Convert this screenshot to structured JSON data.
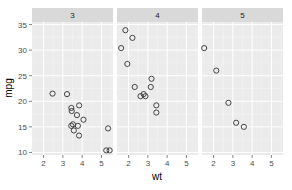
{
  "chart_data": {
    "type": "scatter",
    "facet_by": "gear",
    "xlabel": "wt",
    "ylabel": "mpg",
    "x_ticks": [
      2,
      3,
      4,
      5
    ],
    "y_ticks": [
      10,
      15,
      20,
      25,
      30,
      35
    ],
    "xlim": [
      1.4,
      5.6
    ],
    "ylim": [
      9.5,
      35.5
    ],
    "grid": true,
    "legend": "none",
    "colors": {
      "panel_bg": "#ebebeb",
      "strip_bg": "#d9d9d9",
      "grid_major": "#ffffff",
      "point_stroke": "#333333"
    },
    "panels": [
      {
        "label": "3",
        "points": [
          {
            "x": 3.215,
            "y": 21.4
          },
          {
            "x": 3.44,
            "y": 18.7
          },
          {
            "x": 3.46,
            "y": 18.1
          },
          {
            "x": 3.57,
            "y": 14.3
          },
          {
            "x": 4.07,
            "y": 16.4
          },
          {
            "x": 3.73,
            "y": 17.3
          },
          {
            "x": 3.78,
            "y": 15.2
          },
          {
            "x": 5.25,
            "y": 10.4
          },
          {
            "x": 5.424,
            "y": 10.4
          },
          {
            "x": 5.345,
            "y": 14.7
          },
          {
            "x": 2.465,
            "y": 21.5
          },
          {
            "x": 3.52,
            "y": 15.5
          },
          {
            "x": 3.435,
            "y": 15.2
          },
          {
            "x": 3.84,
            "y": 13.3
          },
          {
            "x": 3.845,
            "y": 19.2
          }
        ]
      },
      {
        "label": "4",
        "points": [
          {
            "x": 2.62,
            "y": 21.0
          },
          {
            "x": 2.875,
            "y": 21.0
          },
          {
            "x": 2.32,
            "y": 22.8
          },
          {
            "x": 3.19,
            "y": 24.4
          },
          {
            "x": 3.15,
            "y": 22.8
          },
          {
            "x": 3.44,
            "y": 19.2
          },
          {
            "x": 3.44,
            "y": 17.8
          },
          {
            "x": 2.2,
            "y": 32.4
          },
          {
            "x": 1.615,
            "y": 30.4
          },
          {
            "x": 1.835,
            "y": 33.9
          },
          {
            "x": 1.935,
            "y": 27.3
          },
          {
            "x": 2.78,
            "y": 21.4
          }
        ]
      },
      {
        "label": "5",
        "points": [
          {
            "x": 2.14,
            "y": 26.0
          },
          {
            "x": 1.513,
            "y": 30.4
          },
          {
            "x": 3.17,
            "y": 15.8
          },
          {
            "x": 2.77,
            "y": 19.7
          },
          {
            "x": 3.57,
            "y": 15.0
          }
        ]
      }
    ]
  }
}
